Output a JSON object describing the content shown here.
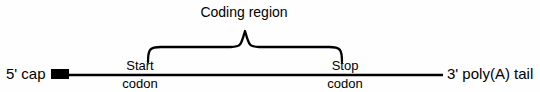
{
  "diagram": {
    "title": "Coding region",
    "labels": {
      "five_prime_cap": "5' cap",
      "three_prime_tail": "3' poly(A) tail",
      "start_codon_line1": "Start",
      "start_codon_line2": "codon",
      "stop_codon_line1": "Stop",
      "stop_codon_line2": "codon"
    },
    "colors": {
      "stroke": "#000000",
      "background": "#fefefe",
      "cap_fill": "#000000"
    },
    "geometry": {
      "backbone_y": 75,
      "backbone_x_start": 52,
      "backbone_x_end": 443,
      "cap_box_x": 51,
      "cap_box_y": 69,
      "cap_box_width": 18,
      "cap_box_height": 10,
      "brace_left_x": 148,
      "brace_right_x": 342,
      "brace_peak_x": 245,
      "brace_top_y": 30,
      "brace_bottom_y": 62
    }
  }
}
